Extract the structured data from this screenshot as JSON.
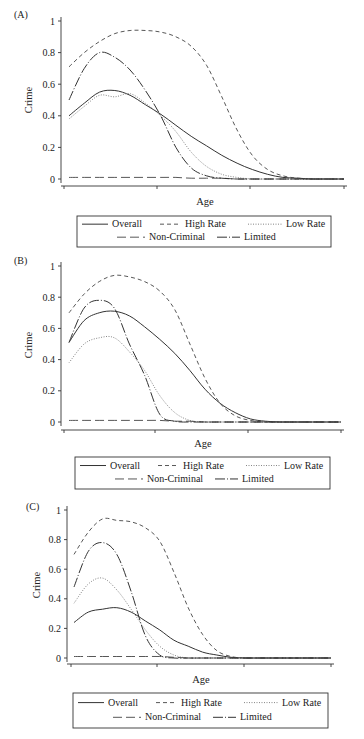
{
  "figure": {
    "xlabel": "Age",
    "ylabel": "Crime",
    "yticks": [
      "0",
      "0.2",
      "0.4",
      "0.6",
      "0.8",
      "1"
    ],
    "legend": {
      "overall": "Overall",
      "high_rate": "High Rate",
      "low_rate": "Low Rate",
      "non_criminal": "Non-Criminal",
      "limited": "Limited"
    }
  },
  "panels": [
    {
      "label": "(A)"
    },
    {
      "label": "(B)"
    },
    {
      "label": "(C)"
    }
  ],
  "chart_data": [
    {
      "type": "line",
      "title": "(A)",
      "xlabel": "Age",
      "ylabel": "Crime",
      "ylim": [
        0,
        1
      ],
      "yticks": [
        0,
        0.2,
        0.4,
        0.6,
        0.8,
        1
      ],
      "xticks_labeled": false,
      "grid": false,
      "legend_position": "below",
      "x": [
        0,
        1,
        2,
        3,
        4,
        5,
        6,
        7,
        8,
        9,
        10,
        11,
        12,
        13,
        14,
        15,
        16,
        17,
        18
      ],
      "series": [
        {
          "name": "Overall",
          "style": "solid",
          "values": [
            0.4,
            0.48,
            0.55,
            0.56,
            0.53,
            0.47,
            0.41,
            0.34,
            0.27,
            0.21,
            0.15,
            0.1,
            0.06,
            0.03,
            0.01,
            0.005,
            0,
            0,
            0
          ]
        },
        {
          "name": "High Rate",
          "style": "dashed",
          "values": [
            0.71,
            0.8,
            0.87,
            0.92,
            0.94,
            0.94,
            0.93,
            0.9,
            0.84,
            0.72,
            0.52,
            0.31,
            0.15,
            0.06,
            0.02,
            0.005,
            0,
            0,
            0
          ]
        },
        {
          "name": "Low Rate",
          "style": "dotted",
          "values": [
            0.38,
            0.46,
            0.53,
            0.52,
            0.54,
            0.48,
            0.4,
            0.3,
            0.17,
            0.08,
            0.03,
            0.01,
            0,
            0,
            0,
            0,
            0,
            0,
            0
          ]
        },
        {
          "name": "Non-Criminal",
          "style": "longdash",
          "values": [
            0.01,
            0.01,
            0.01,
            0.01,
            0.01,
            0.01,
            0.01,
            0.01,
            0.005,
            0.005,
            0.005,
            0,
            0,
            0,
            0,
            0,
            0,
            0,
            0
          ]
        },
        {
          "name": "Limited",
          "style": "dashdot",
          "values": [
            0.5,
            0.7,
            0.8,
            0.77,
            0.69,
            0.56,
            0.4,
            0.2,
            0.07,
            0.02,
            0.005,
            0,
            0,
            0,
            0,
            0,
            0,
            0,
            0
          ]
        }
      ]
    },
    {
      "type": "line",
      "title": "(B)",
      "xlabel": "Age",
      "ylabel": "Crime",
      "ylim": [
        0,
        1
      ],
      "yticks": [
        0,
        0.2,
        0.4,
        0.6,
        0.8,
        1
      ],
      "xticks_labeled": false,
      "grid": false,
      "legend_position": "below",
      "x": [
        0,
        1,
        2,
        3,
        4,
        5,
        6,
        7,
        8,
        9,
        10,
        11,
        12,
        13,
        14,
        15,
        16,
        17,
        18
      ],
      "series": [
        {
          "name": "Overall",
          "style": "solid",
          "values": [
            0.51,
            0.65,
            0.7,
            0.71,
            0.68,
            0.61,
            0.53,
            0.44,
            0.33,
            0.21,
            0.12,
            0.06,
            0.02,
            0.005,
            0,
            0,
            0,
            0,
            0
          ]
        },
        {
          "name": "High Rate",
          "style": "dashed",
          "values": [
            0.7,
            0.82,
            0.9,
            0.94,
            0.93,
            0.9,
            0.84,
            0.72,
            0.5,
            0.28,
            0.12,
            0.04,
            0.01,
            0,
            0,
            0,
            0,
            0,
            0
          ]
        },
        {
          "name": "Low Rate",
          "style": "dotted",
          "values": [
            0.38,
            0.5,
            0.54,
            0.54,
            0.45,
            0.33,
            0.17,
            0.06,
            0.01,
            0,
            0,
            0,
            0,
            0,
            0,
            0,
            0,
            0,
            0
          ]
        },
        {
          "name": "Non-Criminal",
          "style": "longdash",
          "values": [
            0.01,
            0.01,
            0.01,
            0.01,
            0.01,
            0.01,
            0.01,
            0.005,
            0.005,
            0,
            0,
            0,
            0,
            0,
            0,
            0,
            0,
            0,
            0
          ]
        },
        {
          "name": "Limited",
          "style": "dashdot",
          "values": [
            0.51,
            0.73,
            0.78,
            0.73,
            0.5,
            0.3,
            0.05,
            0.005,
            0,
            0,
            0,
            0,
            0,
            0,
            0,
            0,
            0,
            0,
            0
          ]
        }
      ]
    },
    {
      "type": "line",
      "title": "(C)",
      "xlabel": "Age",
      "ylabel": "Crime",
      "ylim": [
        0,
        1
      ],
      "yticks": [
        0,
        0.2,
        0.4,
        0.6,
        0.8,
        1
      ],
      "xticks_labeled": false,
      "grid": false,
      "legend_position": "below",
      "x": [
        0,
        1,
        2,
        3,
        4,
        5,
        6,
        7,
        8,
        9,
        10,
        11,
        12,
        13,
        14,
        15,
        16,
        17,
        18
      ],
      "series": [
        {
          "name": "Overall",
          "style": "solid",
          "values": [
            0.24,
            0.31,
            0.33,
            0.34,
            0.31,
            0.25,
            0.19,
            0.12,
            0.08,
            0.04,
            0.02,
            0.005,
            0,
            0,
            0,
            0,
            0,
            0,
            0
          ]
        },
        {
          "name": "High Rate",
          "style": "dashed",
          "values": [
            0.7,
            0.85,
            0.94,
            0.93,
            0.92,
            0.88,
            0.79,
            0.58,
            0.34,
            0.16,
            0.05,
            0.01,
            0,
            0,
            0,
            0,
            0,
            0,
            0
          ]
        },
        {
          "name": "Low Rate",
          "style": "dotted",
          "values": [
            0.37,
            0.5,
            0.54,
            0.46,
            0.33,
            0.19,
            0.08,
            0.02,
            0,
            0,
            0,
            0,
            0,
            0,
            0,
            0,
            0,
            0,
            0
          ]
        },
        {
          "name": "Non-Criminal",
          "style": "longdash",
          "values": [
            0.01,
            0.01,
            0.01,
            0.01,
            0.01,
            0.01,
            0.01,
            0.005,
            0,
            0,
            0,
            0,
            0,
            0,
            0,
            0,
            0,
            0,
            0
          ]
        },
        {
          "name": "Limited",
          "style": "dashdot",
          "values": [
            0.48,
            0.72,
            0.78,
            0.7,
            0.45,
            0.15,
            0.02,
            0,
            0,
            0,
            0,
            0,
            0,
            0,
            0,
            0,
            0,
            0,
            0
          ]
        }
      ]
    }
  ]
}
